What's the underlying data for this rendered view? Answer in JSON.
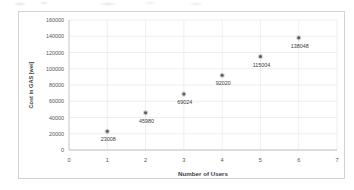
{
  "chart_data": {
    "type": "scatter",
    "title": "",
    "xlabel": "Number of Users",
    "ylabel": "Cost in GAS [wei]",
    "x": [
      1,
      2,
      3,
      4,
      5,
      6
    ],
    "values": [
      23008,
      45980,
      69024,
      92020,
      115004,
      138048
    ],
    "point_labels": [
      "23008",
      "45980",
      "69024",
      "92020",
      "115004",
      "138048"
    ],
    "xlim": [
      0,
      7
    ],
    "ylim": [
      0,
      160000
    ],
    "xticks": [
      "0",
      "1",
      "2",
      "3",
      "4",
      "5",
      "6",
      "7"
    ],
    "yticks": [
      "0",
      "20000",
      "40000",
      "60000",
      "80000",
      "100000",
      "120000",
      "140000",
      "160000"
    ],
    "grid": true,
    "legend": false,
    "marker_color": "#5a5a5a",
    "grid_color": "#e2e2e2",
    "axis_color": "#b8b8b8"
  }
}
